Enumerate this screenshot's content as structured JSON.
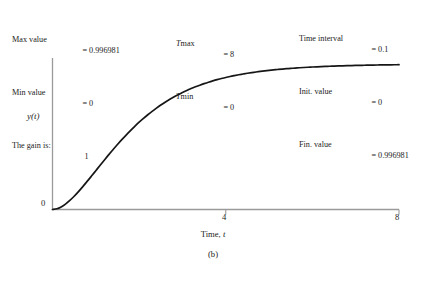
{
  "figure": {
    "caption": "(b)",
    "background": "#ffffff",
    "curve_color": "#161616",
    "axis_color": "#9a9a9a"
  },
  "annotations": {
    "left": [
      {
        "key": "Max value",
        "eq": "=",
        "value": "0.996981"
      },
      {
        "key": "Min value",
        "eq": "=",
        "value": "0"
      },
      {
        "key": "The gain is:",
        "eq": "",
        "value": "1"
      }
    ],
    "middle": [
      {
        "key_italic": "T",
        "key_rest": "max",
        "eq": "=",
        "value": "8"
      },
      {
        "key_italic": "T",
        "key_rest": "min",
        "eq": "=",
        "value": "0"
      }
    ],
    "right": [
      {
        "key": "Time interval",
        "eq": "=",
        "value": "0.1"
      },
      {
        "key": "Init. value",
        "eq": "=",
        "value": "0"
      },
      {
        "key": "Fin. value",
        "eq": "=",
        "value": "0.996981"
      }
    ]
  },
  "axes": {
    "ylabel": "y(t)",
    "xlabel_prefix": "Time, ",
    "xlabel_italic": "t",
    "xticks": [
      {
        "value": 0,
        "label": "0"
      },
      {
        "value": 4,
        "label": "4"
      },
      {
        "value": 8,
        "label": "8"
      }
    ]
  },
  "chart_data": {
    "type": "line",
    "title": "",
    "xlabel": "Time, t",
    "ylabel": "y(t)",
    "xlim": [
      0,
      8
    ],
    "ylim": [
      0,
      1.07
    ],
    "grid": false,
    "legend": null,
    "annotations": {
      "max_value": 0.996981,
      "min_value": 0,
      "gain": 1,
      "t_max": 8,
      "t_min": 0,
      "time_interval": 0.1,
      "initial_value": 0,
      "final_value": 0.996981
    },
    "series": [
      {
        "name": "y(t)",
        "x": [
          0,
          0.1,
          0.2,
          0.3,
          0.4,
          0.5,
          0.6,
          0.7,
          0.8,
          0.9,
          1.0,
          1.1,
          1.2,
          1.3,
          1.4,
          1.5,
          1.6,
          1.7,
          1.8,
          1.9,
          2.0,
          2.1,
          2.2,
          2.3,
          2.4,
          2.5,
          2.6,
          2.7,
          2.8,
          2.9,
          3.0,
          3.1,
          3.2,
          3.3,
          3.4,
          3.5,
          3.6,
          3.7,
          3.8,
          3.9,
          4.0,
          4.1,
          4.2,
          4.3,
          4.4,
          4.5,
          4.6,
          4.7,
          4.8,
          4.9,
          5.0,
          5.1,
          5.2,
          5.3,
          5.4,
          5.5,
          5.6,
          5.7,
          5.8,
          5.9,
          6.0,
          6.1,
          6.2,
          6.3,
          6.4,
          6.5,
          6.6,
          6.7,
          6.8,
          6.9,
          7.0,
          7.1,
          7.2,
          7.3,
          7.4,
          7.5,
          7.6,
          7.7,
          7.8,
          7.9,
          8.0
        ],
        "y": [
          0,
          0.00468,
          0.01752,
          0.0369,
          0.06155,
          0.0902,
          0.1219,
          0.1558,
          0.1912,
          0.2275,
          0.2642,
          0.301,
          0.3374,
          0.3733,
          0.4084,
          0.4422,
          0.4751,
          0.5066,
          0.5369,
          0.5658,
          0.594,
          0.6199,
          0.6447,
          0.6681,
          0.6901,
          0.7108,
          0.7301,
          0.7483,
          0.7653,
          0.7812,
          0.796,
          0.8099,
          0.8228,
          0.8348,
          0.846,
          0.8564,
          0.8661,
          0.8751,
          0.8834,
          0.8912,
          0.8984,
          0.905,
          0.9112,
          0.9169,
          0.9222,
          0.9271,
          0.9317,
          0.9359,
          0.9399,
          0.9435,
          0.9469,
          0.95,
          0.9529,
          0.9556,
          0.9581,
          0.9604,
          0.9625,
          0.9645,
          0.9663,
          0.968,
          0.9696,
          0.9711,
          0.9724,
          0.9737,
          0.9748,
          0.9759,
          0.9769,
          0.9778,
          0.9787,
          0.9795,
          0.9802,
          0.9809,
          0.9816,
          0.9822,
          0.9827,
          0.9833,
          0.9838,
          0.9842,
          0.9846,
          0.985,
          0.9854
        ]
      }
    ]
  }
}
